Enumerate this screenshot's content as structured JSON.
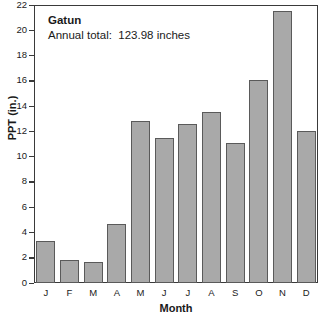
{
  "chart_data": {
    "type": "bar",
    "title": "Gatun",
    "subtitle": "Annual total:  123.98 inches",
    "xlabel": "Month",
    "ylabel": "PPT (in.)",
    "categories": [
      "J",
      "F",
      "M",
      "A",
      "M",
      "J",
      "J",
      "A",
      "S",
      "O",
      "N",
      "D"
    ],
    "category_names": [
      "January",
      "February",
      "March",
      "April",
      "May",
      "June",
      "July",
      "August",
      "September",
      "October",
      "November",
      "December"
    ],
    "values": [
      3.3,
      1.8,
      1.7,
      4.7,
      12.8,
      11.45,
      12.6,
      13.5,
      11.1,
      16.1,
      21.5,
      12.0
    ],
    "ylim": [
      0,
      22
    ],
    "yticks": [
      0,
      2,
      4,
      6,
      8,
      10,
      12,
      14,
      16,
      18,
      20,
      22
    ],
    "ytick_labels": [
      "0",
      "2",
      "4",
      "6",
      "8",
      "10",
      "12",
      "14",
      "16",
      "18",
      "20",
      "22"
    ],
    "grid": false,
    "legend": null,
    "bar_color": "#a9a9a9",
    "bar_edge_color": "#5a5a5a",
    "axis_color": "#3a3a3a",
    "background_color": "#ffffff"
  },
  "annotation": {
    "station": "Gatun",
    "annual_total": "Annual total:  123.98 inches"
  },
  "axes": {
    "y_title": "PPT (in.)",
    "x_title": "Month"
  }
}
